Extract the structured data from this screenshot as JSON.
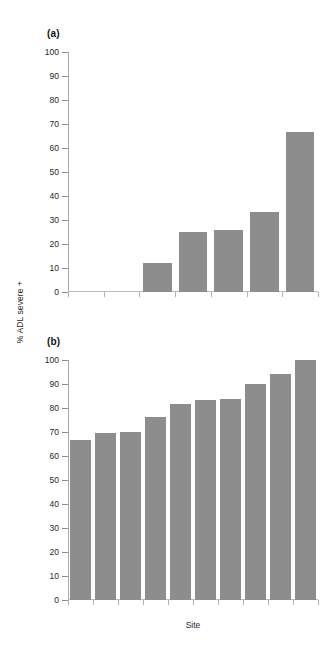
{
  "figure": {
    "ylabel": "% ADL severe +",
    "xlabel": "Site",
    "bar_color": "#8d8d8d",
    "axis_color": "#a8a8a8",
    "background": "#ffffff"
  },
  "panels": [
    {
      "tag": "(a)"
    },
    {
      "tag": "(b)"
    }
  ],
  "yticks": [
    "0",
    "10",
    "20",
    "30",
    "40",
    "50",
    "60",
    "70",
    "80",
    "90",
    "100"
  ],
  "chart_data": [
    {
      "type": "bar",
      "title": "(a)",
      "xlabel": "",
      "ylabel": "% ADL severe +",
      "ylim": [
        0,
        100
      ],
      "yticks": [
        0,
        10,
        20,
        30,
        40,
        50,
        60,
        70,
        80,
        90,
        100
      ],
      "grid": false,
      "legend": "none",
      "categories": [
        "1",
        "2",
        "3",
        "4",
        "5",
        "6",
        "7"
      ],
      "values": [
        0,
        0,
        12.0,
        25.0,
        26.0,
        33.5,
        66.7
      ],
      "notes": "Seven site slots; the first two sites have no visible bar (0%). Bar tops read against y-axis ticks."
    },
    {
      "type": "bar",
      "title": "(b)",
      "xlabel": "Site",
      "ylabel": "% ADL severe +",
      "ylim": [
        0,
        100
      ],
      "yticks": [
        0,
        10,
        20,
        30,
        40,
        50,
        60,
        70,
        80,
        90,
        100
      ],
      "grid": false,
      "legend": "none",
      "categories": [
        "1",
        "2",
        "3",
        "4",
        "5",
        "6",
        "7",
        "8",
        "9",
        "10"
      ],
      "values": [
        66.5,
        69.7,
        69.8,
        76.2,
        81.7,
        83.5,
        83.8,
        90.0,
        94.0,
        100.0
      ],
      "notes": "Ten site bars in ascending order."
    }
  ]
}
